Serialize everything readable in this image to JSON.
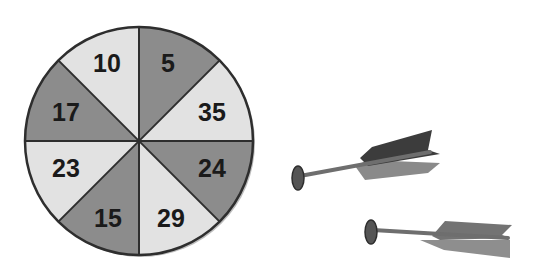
{
  "dartboard": {
    "center": [
      139,
      141
    ],
    "radius": 114,
    "colors": {
      "light": "#e2e2e2",
      "dark": "#8c8c8c",
      "border": "#2e2e2e"
    },
    "segments": [
      {
        "label": "5",
        "shade": "dark"
      },
      {
        "label": "35",
        "shade": "light"
      },
      {
        "label": "24",
        "shade": "dark"
      },
      {
        "label": "29",
        "shade": "light"
      },
      {
        "label": "15",
        "shade": "dark"
      },
      {
        "label": "23",
        "shade": "light"
      },
      {
        "label": "17",
        "shade": "dark"
      },
      {
        "label": "10",
        "shade": "light"
      }
    ]
  },
  "darts": [
    {
      "name": "dart-1",
      "count": 1
    },
    {
      "name": "dart-2",
      "count": 1
    }
  ]
}
